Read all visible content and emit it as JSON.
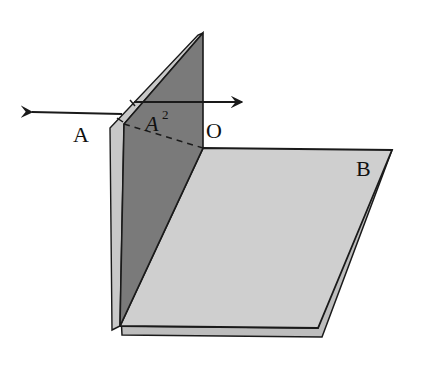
{
  "diagram": {
    "type": "dihedral-angle-fold",
    "labels": {
      "A": "A",
      "A2": "A",
      "A2_sup": "2",
      "O": "O",
      "B": "B"
    },
    "colors": {
      "vertical_plane": "#7a7a7a",
      "vertical_edge": "#c8c8c8",
      "horizontal_plane": "#cfcfcf",
      "horizontal_under": "#bdbdbd",
      "stroke": "#1a1a1a",
      "background": "#ffffff"
    },
    "arrows": [
      {
        "name": "left-arrow",
        "direction": "left"
      },
      {
        "name": "right-arrow",
        "direction": "right"
      }
    ]
  }
}
